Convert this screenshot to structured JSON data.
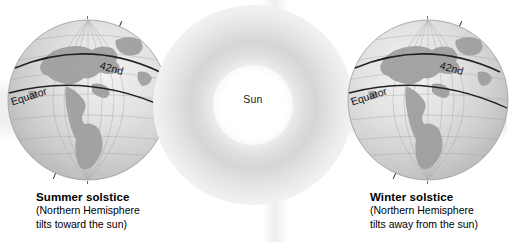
{
  "figure": {
    "background_color": "#ffffff"
  },
  "sun": {
    "label": "Sun",
    "glow_color": "#d6d6d6",
    "core_color": "#ffffff"
  },
  "globes": [
    {
      "id": "left",
      "position": "left",
      "equator_label": "Equator",
      "parallel_label": "42nd",
      "axis_line_name": "rotation-axis",
      "vertical_reference_name": "vertical-dashed-reference",
      "landmass": "North and South America",
      "tilt_degrees": 23.5,
      "ocean_color": "#d9d9d9",
      "land_color": "#9a9a9a",
      "grid_color": "#a8a8a8",
      "parallel_color": "#2b2b2b"
    },
    {
      "id": "right",
      "position": "right",
      "equator_label": "Equator",
      "parallel_label": "42nd",
      "axis_line_name": "rotation-axis",
      "vertical_reference_name": "vertical-dashed-reference",
      "landmass": "North and South America",
      "tilt_degrees": 23.5,
      "ocean_color": "#d9d9d9",
      "land_color": "#9a9a9a",
      "grid_color": "#a8a8a8",
      "parallel_color": "#2b2b2b"
    }
  ],
  "captions": {
    "left": {
      "title": "Summer solstice",
      "line1": "(Northern Hemisphere",
      "line2": "tilts toward the sun)"
    },
    "right": {
      "title": "Winter solstice",
      "line1": "(Northern Hemisphere",
      "line2": "tilts away from the sun)"
    }
  }
}
